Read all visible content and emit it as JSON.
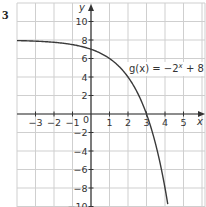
{
  "question": {
    "number": "3"
  },
  "chart_data": {
    "type": "line",
    "title": "",
    "xlabel": "x",
    "ylabel": "y",
    "xlim": [
      -4,
      6
    ],
    "ylim": [
      -10,
      11
    ],
    "grid": true,
    "x_ticks": [
      "−3",
      "−2",
      "−1",
      "1",
      "2",
      "3",
      "4",
      "5"
    ],
    "x_tick_values": [
      -3,
      -2,
      -1,
      1,
      2,
      3,
      4,
      5
    ],
    "y_ticks": [
      "10",
      "8",
      "6",
      "4",
      "2",
      "−2",
      "−4",
      "−6",
      "−8",
      "−10"
    ],
    "y_tick_values": [
      10,
      8,
      6,
      4,
      2,
      -2,
      -4,
      -6,
      -8,
      -10
    ],
    "origin_label": "0",
    "series": [
      {
        "name": "g(x) = −2ˣ + 8",
        "function": "-2^x + 8",
        "x": [
          -4,
          -3,
          -2,
          -1,
          0,
          1,
          2,
          3,
          3.5,
          4
        ],
        "values": [
          7.94,
          7.88,
          7.75,
          7.5,
          7,
          6,
          4,
          0,
          -3.31,
          -8
        ]
      }
    ],
    "annotations": [
      {
        "text_prefix": "g(x) = −2",
        "superscript": "x",
        "text_suffix": " + 8",
        "x": 3.9,
        "y": 5.3
      }
    ]
  }
}
